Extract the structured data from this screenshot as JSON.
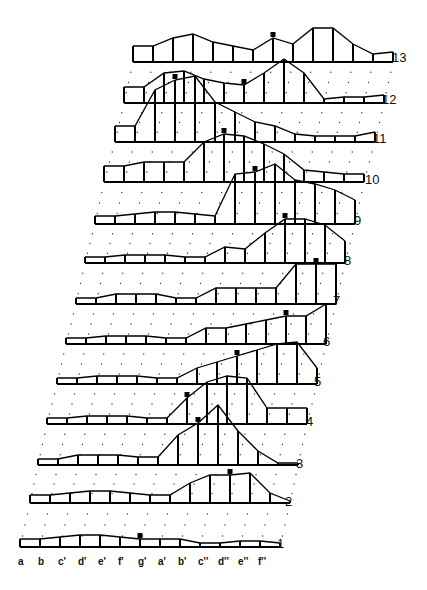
{
  "figure": {
    "type": "stacked frequency profiles",
    "note_labels": [
      "a",
      "b",
      "c'",
      "d'",
      "e'",
      "f'",
      "g'",
      "a'",
      "b'",
      "c''",
      "d''",
      "e''",
      "f''"
    ],
    "bin_width": 20,
    "rows": [
      {
        "label": "1",
        "baseline": 547,
        "x0": 20,
        "heights": [
          8,
          8,
          10,
          12,
          12,
          10,
          8,
          8,
          8,
          4,
          4,
          6,
          6,
          4,
          4
        ],
        "marker_bin": 6
      },
      {
        "label": "2",
        "baseline": 503,
        "x0": 30,
        "heights": [
          8,
          8,
          10,
          12,
          12,
          10,
          8,
          8,
          20,
          28,
          28,
          30,
          10,
          2,
          2
        ],
        "marker_bin": 10
      },
      {
        "label": "3",
        "baseline": 465,
        "x0": 38,
        "heights": [
          6,
          6,
          10,
          10,
          10,
          8,
          8,
          30,
          42,
          60,
          34,
          14,
          2,
          2,
          2
        ],
        "marker_bin": 8
      },
      {
        "label": "4",
        "baseline": 424,
        "x0": 47,
        "heights": [
          6,
          6,
          8,
          8,
          8,
          6,
          6,
          26,
          42,
          48,
          46,
          16,
          16,
          16,
          16
        ],
        "marker_bin": 7
      },
      {
        "label": "5",
        "baseline": 384,
        "x0": 57,
        "heights": [
          6,
          6,
          8,
          8,
          8,
          6,
          6,
          16,
          22,
          28,
          34,
          40,
          42,
          16,
          16
        ],
        "marker_bin": 9
      },
      {
        "label": "6",
        "baseline": 344,
        "x0": 66,
        "heights": [
          6,
          6,
          8,
          8,
          8,
          6,
          6,
          16,
          16,
          20,
          24,
          28,
          28,
          40,
          40
        ],
        "marker_bin": 11
      },
      {
        "label": "7",
        "baseline": 304,
        "x0": 76,
        "heights": [
          6,
          6,
          10,
          10,
          10,
          6,
          6,
          16,
          16,
          16,
          16,
          40,
          40,
          40,
          28
        ],
        "marker_bin": 12
      },
      {
        "label": "8",
        "baseline": 263,
        "x0": 85,
        "heights": [
          6,
          6,
          8,
          8,
          8,
          6,
          6,
          16,
          14,
          30,
          44,
          44,
          38,
          22,
          22
        ],
        "marker_bin": 10
      },
      {
        "label": "9",
        "baseline": 224,
        "x0": 95,
        "heights": [
          8,
          8,
          10,
          12,
          12,
          10,
          8,
          50,
          52,
          60,
          44,
          40,
          34,
          24,
          24
        ],
        "marker_bin": 8
      },
      {
        "label": "10",
        "baseline": 182,
        "x0": 104,
        "heights": [
          16,
          16,
          20,
          20,
          20,
          40,
          48,
          46,
          38,
          28,
          12,
          10,
          8,
          8,
          8
        ],
        "marker_bin": 6
      },
      {
        "label": "11",
        "baseline": 142,
        "x0": 115,
        "heights": [
          16,
          16,
          52,
          62,
          66,
          40,
          30,
          20,
          16,
          8,
          6,
          6,
          6,
          10,
          10
        ],
        "marker_bin": 3
      },
      {
        "label": "12",
        "baseline": 103,
        "x0": 124,
        "heights": [
          16,
          16,
          30,
          32,
          24,
          20,
          18,
          30,
          44,
          30,
          4,
          6,
          6,
          8,
          8
        ],
        "marker_bin": 6
      },
      {
        "label": "13",
        "baseline": 62,
        "x0": 133,
        "heights": [
          16,
          16,
          24,
          28,
          20,
          16,
          12,
          24,
          18,
          34,
          34,
          18,
          8,
          10,
          10
        ],
        "marker_bin": 7
      }
    ],
    "row_label_positions": [
      {
        "x": 277,
        "y": 536
      },
      {
        "x": 285,
        "y": 494
      },
      {
        "x": 296,
        "y": 456
      },
      {
        "x": 306,
        "y": 414
      },
      {
        "x": 314,
        "y": 374
      },
      {
        "x": 323,
        "y": 334
      },
      {
        "x": 333,
        "y": 293
      },
      {
        "x": 344,
        "y": 253
      },
      {
        "x": 354,
        "y": 213
      },
      {
        "x": 365,
        "y": 172
      },
      {
        "x": 373,
        "y": 131
      },
      {
        "x": 382,
        "y": 92
      },
      {
        "x": 392,
        "y": 50
      }
    ]
  }
}
